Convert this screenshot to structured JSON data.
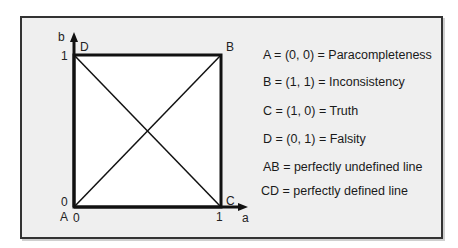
{
  "diagram": {
    "axes": {
      "x_label": "a",
      "y_label": "b",
      "x_ticks": [
        "0",
        "1"
      ],
      "y_ticks": [
        "0",
        "1"
      ]
    },
    "vertices": {
      "A": "A",
      "B": "B",
      "C": "C",
      "D": "D"
    },
    "legend": [
      "A = (0, 0) = Paracompleteness",
      "B = (1, 1) = Inconsistency",
      "C = (1, 0) = Truth",
      "D = (0, 1) = Falsity",
      "AB = perfectly undefined line",
      "CD = perfectly defined line"
    ],
    "colors": {
      "background": "#efefef",
      "square_fill": "#ffffff",
      "stroke": "#111111"
    }
  }
}
